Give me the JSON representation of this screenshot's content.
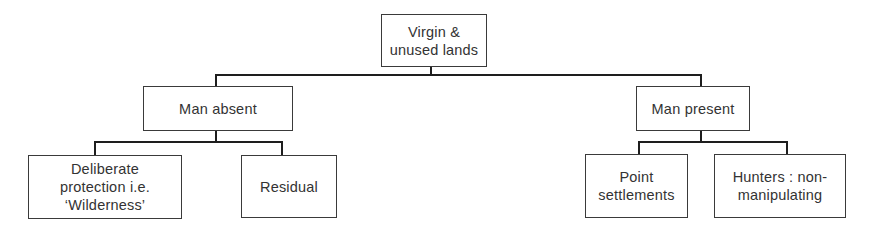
{
  "diagram": {
    "type": "tree",
    "root": {
      "label": "Virgin &\nunused lands",
      "children": [
        {
          "label": "Man absent",
          "children": [
            {
              "label": "Deliberate\nprotection i.e.\n‘Wilderness’"
            },
            {
              "label": "Residual"
            }
          ]
        },
        {
          "label": "Man present",
          "children": [
            {
              "label": "Point\nsettlements"
            },
            {
              "label": "Hunters : non-\nmanipulating"
            }
          ]
        }
      ]
    }
  },
  "nodes": {
    "root": "Virgin &\nunused lands",
    "man_absent": "Man absent",
    "man_present": "Man present",
    "deliberate": "Deliberate\nprotection i.e.\n‘Wilderness’",
    "residual": "Residual",
    "point_settlements": "Point\nsettlements",
    "hunters": "Hunters : non-\nmanipulating"
  }
}
